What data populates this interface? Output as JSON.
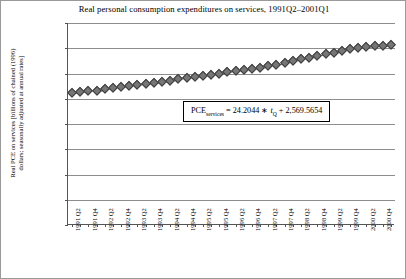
{
  "chart_data": {
    "type": "line",
    "title": "Real personal consumption expenditures on services, 1991Q2–2001Q1",
    "xlabel": "",
    "ylabel_line1": "Real PCE on services [billions of chained (1996)",
    "ylabel_line2": "dollars; seasonally adjusted at annual rates]",
    "ylim": [
      0,
      4000
    ],
    "yticks": [
      0,
      500,
      1000,
      1500,
      2000,
      2500,
      3000,
      3500,
      4000
    ],
    "ytick_labels": [
      "0.0",
      "500.0",
      "1,000.0",
      "1,500.0",
      "2,000.0",
      "2,500.0",
      "3,000.0",
      "3,500.0",
      "4,000.0"
    ],
    "grid": true,
    "legend": "none",
    "marker": "diamond",
    "marker_color": "#767676",
    "line_color": "#5e5e5e",
    "categories": [
      "1991 Q2",
      "1991 Q3",
      "1991 Q4",
      "1992 Q1",
      "1992 Q2",
      "1992 Q3",
      "1992 Q4",
      "1993 Q1",
      "1993 Q2",
      "1993 Q3",
      "1993 Q4",
      "1994 Q1",
      "1994 Q2",
      "1994 Q3",
      "1994 Q4",
      "1995 Q1",
      "1995 Q2",
      "1995 Q3",
      "1995 Q4",
      "1996 Q1",
      "1996 Q2",
      "1996 Q3",
      "1996 Q4",
      "1997 Q1",
      "1997 Q2",
      "1997 Q3",
      "1997 Q4",
      "1998 Q1",
      "1998 Q2",
      "1998 Q3",
      "1998 Q4",
      "1999 Q1",
      "1999 Q2",
      "1999 Q3",
      "1999 Q4",
      "2000 Q1",
      "2000 Q2",
      "2000 Q3",
      "2000 Q4",
      "2001 Q1"
    ],
    "xtick_labels": [
      "1991 Q2",
      "1991 Q4",
      "1992 Q2",
      "1992 Q4",
      "1993 Q2",
      "1993 Q4",
      "1994 Q2",
      "1994 Q4",
      "1995 Q2",
      "1995 Q4",
      "1996 Q2",
      "1996 Q4",
      "1997 Q2",
      "1997 Q4",
      "1998 Q2",
      "1998 Q4",
      "1999 Q2",
      "1999 Q4",
      "2000 Q2",
      "2000 Q4"
    ],
    "values": [
      2612,
      2628,
      2645,
      2663,
      2684,
      2703,
      2726,
      2748,
      2772,
      2795,
      2818,
      2836,
      2858,
      2882,
      2906,
      2928,
      2947,
      2971,
      2995,
      3024,
      3046,
      3070,
      3096,
      3118,
      3145,
      3175,
      3208,
      3243,
      3278,
      3310,
      3345,
      3381,
      3412,
      3444,
      3478,
      3508,
      3527,
      3543,
      3552,
      3560
    ]
  },
  "annotation": {
    "eq_lhs": "PCE",
    "eq_lhs_sub": "services",
    "eq_equals": " = 24.2044 ∗ ",
    "eq_var": "t",
    "eq_var_sub": "Q",
    "eq_rhs": " + 2,569.5654"
  }
}
